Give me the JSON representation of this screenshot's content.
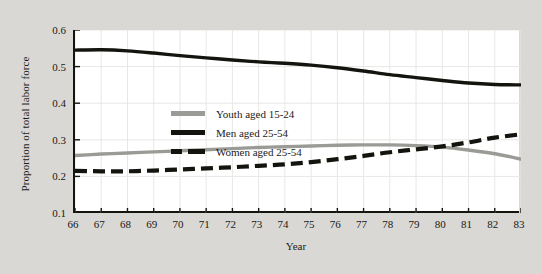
{
  "chart_data": {
    "type": "line",
    "title": "",
    "xlabel": "Year",
    "ylabel": "Proportion of total labor force",
    "xlim": [
      66,
      83
    ],
    "ylim": [
      0.1,
      0.6
    ],
    "yticks": [
      "0.6",
      "0.5",
      "0.4",
      "0.3",
      "0.2",
      "0.1"
    ],
    "ytick_values": [
      0.6,
      0.5,
      0.4,
      0.3,
      0.2,
      0.1
    ],
    "xticks": [
      "66",
      "67",
      "68",
      "69",
      "70",
      "71",
      "72",
      "73",
      "74",
      "75",
      "76",
      "77",
      "78",
      "79",
      "80",
      "81",
      "82",
      "83"
    ],
    "x": [
      66,
      67,
      68,
      69,
      70,
      71,
      72,
      73,
      74,
      75,
      76,
      77,
      78,
      79,
      80,
      81,
      82,
      83
    ],
    "grid": true,
    "legend_position": "upper-left-inside",
    "series": [
      {
        "name": "Youth aged 15-24",
        "style": "solid",
        "color": "#9a9a96",
        "values": [
          0.257,
          0.261,
          0.264,
          0.267,
          0.27,
          0.273,
          0.276,
          0.279,
          0.281,
          0.283,
          0.285,
          0.286,
          0.286,
          0.284,
          0.28,
          0.272,
          0.262,
          0.247
        ]
      },
      {
        "name": "Men aged 25-54",
        "style": "solid",
        "color": "#14140f",
        "values": [
          0.545,
          0.546,
          0.543,
          0.537,
          0.53,
          0.524,
          0.518,
          0.513,
          0.509,
          0.504,
          0.497,
          0.488,
          0.478,
          0.47,
          0.462,
          0.455,
          0.451,
          0.45
        ]
      },
      {
        "name": "Women aged 25-54",
        "style": "dashed",
        "color": "#14140f",
        "values": [
          0.215,
          0.214,
          0.214,
          0.216,
          0.219,
          0.222,
          0.225,
          0.229,
          0.233,
          0.239,
          0.247,
          0.256,
          0.266,
          0.274,
          0.282,
          0.293,
          0.306,
          0.315
        ]
      }
    ]
  },
  "colors": {
    "page_background": "#d9d8d4",
    "plot_background": "#ffffff",
    "axis": "#15150f",
    "grid": "#e7e7e5",
    "youth": "#9a9a96",
    "men": "#14140f",
    "women": "#14140f"
  }
}
